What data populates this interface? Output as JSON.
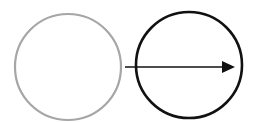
{
  "diagram": {
    "shapes": [
      {
        "id": "source-circle",
        "type": "circle",
        "cx": 68,
        "cy": 67,
        "r": 53,
        "stroke": "#a6a6a6",
        "stroke_width": 2.2,
        "fill": "none"
      },
      {
        "id": "target-circle",
        "type": "circle",
        "cx": 189,
        "cy": 65,
        "r": 53,
        "stroke": "#111111",
        "stroke_width": 2.6,
        "fill": "none"
      }
    ],
    "arrow": {
      "x1": 125,
      "y1": 67,
      "x2": 235,
      "y2": 67,
      "color": "#111111",
      "stroke_width": 1.6,
      "head": "filled-triangle"
    }
  }
}
